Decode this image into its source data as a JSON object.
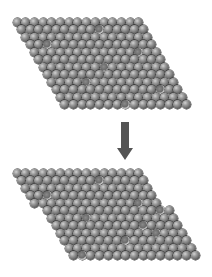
{
  "diagram": {
    "sphere_spacing_px": 8.7,
    "row_spacing_px": 7.45,
    "row_shift_px": 4.35,
    "atoms_per_row": 15,
    "top_lattice": {
      "name": "before-slip",
      "origin_x": 17,
      "origin_y": 18,
      "rows": 12,
      "row_extra_offset": [
        0,
        0,
        0,
        0,
        0,
        0,
        0,
        0,
        0,
        0,
        0,
        0
      ],
      "marked_atoms": [
        [
          1,
          9
        ],
        [
          3,
          2
        ],
        [
          4,
          12
        ],
        [
          6,
          7
        ],
        [
          8,
          4
        ],
        [
          9,
          12
        ],
        [
          11,
          7
        ]
      ]
    },
    "bottom_lattice": {
      "name": "after-slip",
      "origin_x": 17,
      "origin_y": 169,
      "rows": 12,
      "row_extra_offset": [
        0,
        0,
        0,
        0,
        0,
        8.7,
        8.7,
        8.7,
        8.7,
        8.7,
        8.7,
        8.7
      ],
      "marked_atoms": [
        [
          1,
          9
        ],
        [
          3,
          2
        ],
        [
          4,
          12
        ],
        [
          5,
          13
        ],
        [
          6,
          4
        ],
        [
          7,
          10
        ],
        [
          8,
          11
        ],
        [
          9,
          7
        ],
        [
          11,
          1
        ]
      ]
    },
    "arrow": {
      "direction": "down",
      "color": "#545454",
      "x_center": 125,
      "y_start": 122,
      "y_end": 160
    }
  }
}
